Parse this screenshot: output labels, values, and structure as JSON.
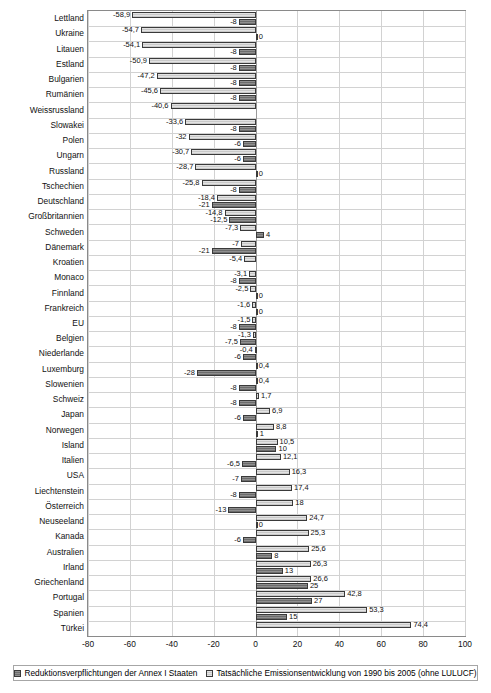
{
  "chart_data": {
    "type": "bar",
    "orientation": "horizontal",
    "title": "",
    "xlabel": "",
    "ylabel": "",
    "xlim": [
      -80,
      100
    ],
    "xticks": [
      -80,
      -60,
      -40,
      -20,
      0,
      20,
      40,
      60,
      80,
      100
    ],
    "xticklabels": [
      "-80",
      "-60",
      "-40",
      "-20",
      "0",
      "20",
      "40",
      "60",
      "80",
      "100"
    ],
    "grid": true,
    "legend_position": "bottom",
    "series": [
      {
        "name": "Tatsächliche Emissionsentwicklung von 1990 bis 2005 (ohne LULUCF)",
        "key": "actual",
        "color": "#d8d8d8"
      },
      {
        "name": "Reduktionsverpflichtungen der Annex I Staaten",
        "key": "commit",
        "color": "#7d7d7d"
      }
    ],
    "categories": [
      "Lettland",
      "Ukraine",
      "Litauen",
      "Estland",
      "Bulgarien",
      "Rumänien",
      "Weissrussland",
      "Slowakei",
      "Polen",
      "Ungarn",
      "Russland",
      "Tschechien",
      "Deutschland",
      "Großbritannien",
      "Schweden",
      "Dänemark",
      "Kroatien",
      "Monaco",
      "Finnland",
      "Frankreich",
      "EU",
      "Belgien",
      "Niederlande",
      "Luxemburg",
      "Slowenien",
      "Schweiz",
      "Japan",
      "Norwegen",
      "Island",
      "Italien",
      "USA",
      "Liechtenstein",
      "Österreich",
      "Neuseeland",
      "Kanada",
      "Australien",
      "Irland",
      "Griechenland",
      "Portugal",
      "Spanien",
      "Türkei"
    ],
    "rows": [
      {
        "category": "Lettland",
        "actual": -58.9,
        "actual_label": "-58,9",
        "commit": -8,
        "commit_label": "-8"
      },
      {
        "category": "Ukraine",
        "actual": -54.7,
        "actual_label": "-54,7",
        "commit": 0,
        "commit_label": "0"
      },
      {
        "category": "Litauen",
        "actual": -54.1,
        "actual_label": "-54,1",
        "commit": -8,
        "commit_label": "-8"
      },
      {
        "category": "Estland",
        "actual": -50.9,
        "actual_label": "-50,9",
        "commit": -8,
        "commit_label": "-8"
      },
      {
        "category": "Bulgarien",
        "actual": -47.2,
        "actual_label": "-47,2",
        "commit": -8,
        "commit_label": "-8"
      },
      {
        "category": "Rumänien",
        "actual": -45.6,
        "actual_label": "-45,6",
        "commit": -8,
        "commit_label": "-8"
      },
      {
        "category": "Weissrussland",
        "actual": -40.6,
        "actual_label": "-40,6",
        "commit": null,
        "commit_label": ""
      },
      {
        "category": "Slowakei",
        "actual": -33.6,
        "actual_label": "-33,6",
        "commit": -8,
        "commit_label": "-8"
      },
      {
        "category": "Polen",
        "actual": -32,
        "actual_label": "-32",
        "commit": -6,
        "commit_label": "-6"
      },
      {
        "category": "Ungarn",
        "actual": -30.7,
        "actual_label": "-30,7",
        "commit": -6,
        "commit_label": "-6"
      },
      {
        "category": "Russland",
        "actual": -28.7,
        "actual_label": "-28,7",
        "commit": 0,
        "commit_label": "0"
      },
      {
        "category": "Tschechien",
        "actual": -25.8,
        "actual_label": "-25,8",
        "commit": -8,
        "commit_label": "-8"
      },
      {
        "category": "Deutschland",
        "actual": -18.4,
        "actual_label": "-18,4",
        "commit": -21,
        "commit_label": "-21"
      },
      {
        "category": "Großbritannien",
        "actual": -14.8,
        "actual_label": "-14,8",
        "commit": -12.5,
        "commit_label": "-12,5"
      },
      {
        "category": "Schweden",
        "actual": -7.3,
        "actual_label": "-7,3",
        "commit": 4,
        "commit_label": "4"
      },
      {
        "category": "Dänemark",
        "actual": -7,
        "actual_label": "-7",
        "commit": -21,
        "commit_label": "-21"
      },
      {
        "category": "Kroatien",
        "actual": -5.4,
        "actual_label": "-5,4",
        "commit": null,
        "commit_label": ""
      },
      {
        "category": "Monaco",
        "actual": -3.1,
        "actual_label": "-3,1",
        "commit": -8,
        "commit_label": "-8"
      },
      {
        "category": "Finnland",
        "actual": -2.5,
        "actual_label": "-2,5",
        "commit": 0,
        "commit_label": "0"
      },
      {
        "category": "Frankreich",
        "actual": -1.6,
        "actual_label": "-1,6",
        "commit": 0,
        "commit_label": "0"
      },
      {
        "category": "EU",
        "actual": -1.5,
        "actual_label": "-1,5",
        "commit": -8,
        "commit_label": "-8"
      },
      {
        "category": "Belgien",
        "actual": -1.3,
        "actual_label": "-1,3",
        "commit": -7.5,
        "commit_label": "-7,5"
      },
      {
        "category": "Niederlande",
        "actual": -0.4,
        "actual_label": "-0,4",
        "commit": -6,
        "commit_label": "-6"
      },
      {
        "category": "Luxemburg",
        "actual": 0.4,
        "actual_label": "0,4",
        "commit": -28,
        "commit_label": "-28"
      },
      {
        "category": "Slowenien",
        "actual": 0.4,
        "actual_label": "0,4",
        "commit": -8,
        "commit_label": "-8"
      },
      {
        "category": "Schweiz",
        "actual": 1.7,
        "actual_label": "1,7",
        "commit": -8,
        "commit_label": "-8"
      },
      {
        "category": "Japan",
        "actual": 6.9,
        "actual_label": "6,9",
        "commit": -6,
        "commit_label": "-6"
      },
      {
        "category": "Norwegen",
        "actual": 8.8,
        "actual_label": "8,8",
        "commit": 1,
        "commit_label": "1"
      },
      {
        "category": "Island",
        "actual": 10.5,
        "actual_label": "10,5",
        "commit": 10,
        "commit_label": "10"
      },
      {
        "category": "Italien",
        "actual": 12.1,
        "actual_label": "12,1",
        "commit": -6.5,
        "commit_label": "-6,5"
      },
      {
        "category": "USA",
        "actual": 16.3,
        "actual_label": "16,3",
        "commit": -7,
        "commit_label": "-7"
      },
      {
        "category": "Liechtenstein",
        "actual": 17.4,
        "actual_label": "17,4",
        "commit": -8,
        "commit_label": "-8"
      },
      {
        "category": "Österreich",
        "actual": 18,
        "actual_label": "18",
        "commit": -13,
        "commit_label": "-13"
      },
      {
        "category": "Neuseeland",
        "actual": 24.7,
        "actual_label": "24,7",
        "commit": 0,
        "commit_label": "0"
      },
      {
        "category": "Kanada",
        "actual": 25.3,
        "actual_label": "25,3",
        "commit": -6,
        "commit_label": "-6"
      },
      {
        "category": "Australien",
        "actual": 25.6,
        "actual_label": "25,6",
        "commit": 8,
        "commit_label": "8"
      },
      {
        "category": "Irland",
        "actual": 26.3,
        "actual_label": "26,3",
        "commit": 13,
        "commit_label": "13"
      },
      {
        "category": "Griechenland",
        "actual": 26.6,
        "actual_label": "26,6",
        "commit": 25,
        "commit_label": "25"
      },
      {
        "category": "Portugal",
        "actual": 42.8,
        "actual_label": "42,8",
        "commit": 27,
        "commit_label": "27"
      },
      {
        "category": "Spanien",
        "actual": 53.3,
        "actual_label": "53,3",
        "commit": 15,
        "commit_label": "15"
      },
      {
        "category": "Türkei",
        "actual": 74.4,
        "actual_label": "74,4",
        "commit": null,
        "commit_label": ""
      }
    ]
  },
  "legend": {
    "items": [
      {
        "label": "Reduktionsverpflichtungen der Annex I Staaten",
        "swatch": "commit"
      },
      {
        "label": "Tatsächliche Emissionsentwicklung von 1990 bis 2005 (ohne LULUCF)",
        "swatch": "actual"
      }
    ]
  }
}
